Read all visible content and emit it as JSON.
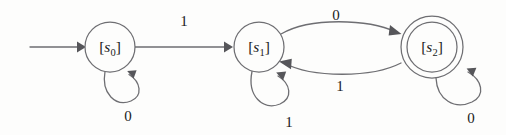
{
  "diagram": {
    "kind": "finite-state-machine",
    "background_color": "#fdfdfc",
    "stroke_color": "#6e6e72",
    "text_color": "#1b1b1b",
    "alphabet": [
      "0",
      "1"
    ],
    "start_state": "[s_0]",
    "accepting_states": [
      "[s_2]"
    ],
    "states": [
      {
        "id": "s0",
        "label_open_bracket": "[",
        "label_symbol": "s",
        "label_subscript": "0",
        "label_close_bracket": "]",
        "label_text": "[s0]",
        "accepting": false,
        "cx": 110,
        "cy": 47,
        "r": 25
      },
      {
        "id": "s1",
        "label_open_bracket": "[",
        "label_symbol": "s",
        "label_subscript": "1",
        "label_close_bracket": "]",
        "label_text": "[s1]",
        "accepting": false,
        "cx": 259,
        "cy": 47,
        "r": 25
      },
      {
        "id": "s2",
        "label_open_bracket": "[",
        "label_symbol": "s",
        "label_subscript": "2",
        "label_close_bracket": "]",
        "label_text": "[s2]",
        "accepting": true,
        "cx": 432,
        "cy": 47,
        "r": 25,
        "r_outer": 31
      }
    ],
    "start_arrow": {
      "name": "start-arrow",
      "from_x": 30,
      "to_x": 84,
      "y": 47
    },
    "transitions": [
      {
        "id": "t-s0-s1",
        "from": "s0",
        "to": "s1",
        "input": "1",
        "label_x": 184,
        "label_y": 26
      },
      {
        "id": "t-s0-s0",
        "from": "s0",
        "to": "s0",
        "input": "0",
        "label_x": 128,
        "label_y": 121,
        "self_loop": true
      },
      {
        "id": "t-s1-s2",
        "from": "s1",
        "to": "s2",
        "input": "0",
        "label_x": 336,
        "label_y": 20
      },
      {
        "id": "t-s2-s1",
        "from": "s2",
        "to": "s1",
        "input": "1",
        "label_x": 340,
        "label_y": 91
      },
      {
        "id": "t-s1-s1",
        "from": "s1",
        "to": "s1",
        "input": "1",
        "label_x": 289,
        "label_y": 127,
        "self_loop": true
      },
      {
        "id": "t-s2-s2",
        "from": "s2",
        "to": "s2",
        "input": "0",
        "label_x": 471,
        "label_y": 123,
        "self_loop": true
      }
    ]
  }
}
